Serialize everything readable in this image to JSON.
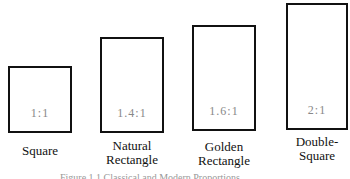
{
  "figure": {
    "shapes": [
      {
        "name": "Square",
        "label_line1": "Square",
        "label_line2": "",
        "ratio": "1:1"
      },
      {
        "name": "Natural Rectangle",
        "label_line1": "Natural",
        "label_line2": "Rectangle",
        "ratio": "1.4:1"
      },
      {
        "name": "Golden Rectangle",
        "label_line1": "Golden",
        "label_line2": "Rectangle",
        "ratio": "1.6:1"
      },
      {
        "name": "Double-Square",
        "label_line1": "Double-",
        "label_line2": "Square",
        "ratio": "2:1"
      }
    ],
    "caption": "Figure 1.1 Classical and Modern Proportions"
  }
}
